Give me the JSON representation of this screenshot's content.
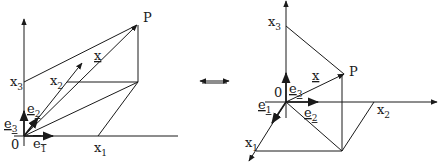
{
  "left_diagram": {
    "labels": {
      "P": "P",
      "x": "x",
      "x1": "x",
      "x1_sub": "1",
      "x2": "x",
      "x2_sub": "2",
      "x3": "x",
      "x3_sub": "3",
      "e1": "e",
      "e1_sub": "1",
      "e2": "e",
      "e2_sub": "2",
      "e3": "e",
      "e3_sub": "3",
      "origin": "0"
    }
  },
  "equivalence_symbol": "⟺",
  "right_diagram": {
    "labels": {
      "P": "P",
      "x": "x",
      "x1": "x",
      "x1_sub": "1",
      "x2": "x",
      "x2_sub": "2",
      "x3": "x",
      "x3_sub": "3",
      "e1": "e",
      "e1_sub": "1",
      "e2": "e",
      "e2_sub": "2",
      "e3": "e",
      "e3_sub": "3",
      "origin": "0"
    }
  }
}
